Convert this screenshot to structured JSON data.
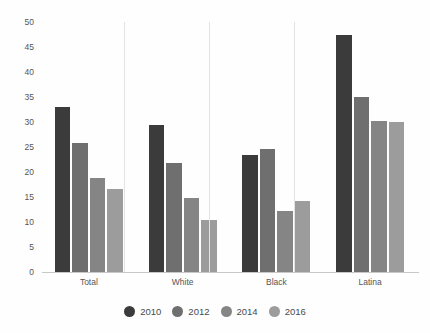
{
  "chart_data": {
    "type": "bar",
    "title": "",
    "subtitle": "",
    "xlabel": "",
    "ylabel": "",
    "categories": [
      "Total",
      "White",
      "Black",
      "Latina"
    ],
    "series": [
      {
        "name": "2010",
        "color": "#3b3b3b",
        "values": [
          33,
          29.5,
          23.5,
          47.5
        ]
      },
      {
        "name": "2012",
        "color": "#6f6f6f",
        "values": [
          25.8,
          21.8,
          24.6,
          35
        ]
      },
      {
        "name": "2014",
        "color": "#858585",
        "values": [
          18.8,
          14.8,
          12.2,
          30.2
        ]
      },
      {
        "name": "2016",
        "color": "#9c9c9c",
        "values": [
          16.6,
          10.4,
          14.2,
          30
        ]
      }
    ],
    "ylim": [
      0,
      50
    ],
    "y_ticks": [
      0,
      5,
      10,
      15,
      20,
      25,
      30,
      35,
      40,
      45,
      50
    ],
    "y_tick_labels": [
      "0",
      "5",
      "10",
      "15",
      "20",
      "25",
      "30",
      "35",
      "40",
      "45",
      "50"
    ],
    "grid": false,
    "legend_position": "bottom",
    "legend_entries": [
      "2010",
      "2012",
      "2014",
      "2016"
    ],
    "annotations": []
  },
  "colors": {
    "background": "#fefefe",
    "axis": "#c8c8c8",
    "tick_text": "#555555",
    "legend_text": "#4a4a4a"
  }
}
